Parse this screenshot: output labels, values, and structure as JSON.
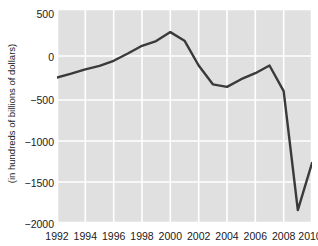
{
  "chart_data": {
    "type": "line",
    "title": "",
    "xlabel": "",
    "ylabel": "(in hundreds of billions of dollars)",
    "x": [
      1992,
      1993,
      1994,
      1995,
      1996,
      1997,
      1998,
      1999,
      2000,
      2001,
      2002,
      2003,
      2004,
      2005,
      2006,
      2007,
      2008,
      2009,
      2010
    ],
    "values": [
      -300,
      -255,
      -205,
      -165,
      -105,
      -20,
      70,
      125,
      230,
      130,
      -160,
      -380,
      -410,
      -320,
      -250,
      -160,
      -460,
      -1850,
      -1300
    ],
    "series": [
      {
        "name": "budget-balance",
        "values": [
          -300,
          -255,
          -205,
          -165,
          -105,
          -20,
          70,
          125,
          230,
          130,
          -160,
          -380,
          -410,
          -320,
          -250,
          -160,
          -460,
          -1850,
          -1300
        ]
      }
    ],
    "xlim": [
      1992,
      2010
    ],
    "ylim": [
      -2000,
      500
    ],
    "x_tick_labels": [
      "1992",
      "1994",
      "1996",
      "1998",
      "2000",
      "2002",
      "2004",
      "2006",
      "2008",
      "2010"
    ],
    "x_tick_values": [
      1992,
      1994,
      1996,
      1998,
      2000,
      2002,
      2004,
      2006,
      2008,
      2010
    ],
    "y_tick_labels": [
      "500",
      "0",
      "−500",
      "−1000",
      "−1500",
      "−2000"
    ],
    "y_tick_values": [
      500,
      0,
      -500,
      -1000,
      -1500,
      -2000
    ],
    "grid": true,
    "legend": "none",
    "line_color": "#3a3a3a",
    "plot_background": "#e0e0e0",
    "grid_color": "#ffffff",
    "page_background": "#ffffff",
    "tick_label_color": "#1a1a1a"
  }
}
